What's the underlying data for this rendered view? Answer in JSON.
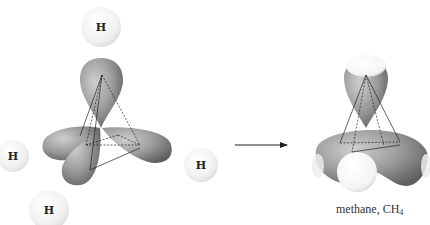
{
  "diagram": {
    "type": "reaction-scheme",
    "left": {
      "name": "sp3 hybrid orbitals of carbon with four hydrogen atoms",
      "hydrogens": [
        {
          "label": "H",
          "cx": 101,
          "cy": 27,
          "r": 20
        },
        {
          "label": "H",
          "cx": 13,
          "cy": 156,
          "r": 16
        },
        {
          "label": "H",
          "cx": 201,
          "cy": 165,
          "r": 17
        },
        {
          "label": "H",
          "cx": 49,
          "cy": 210,
          "r": 20
        }
      ]
    },
    "arrow": {
      "x1": 235,
      "y1": 145,
      "x2": 288,
      "y2": 145
    },
    "right": {
      "caption_prefix": "methane, CH",
      "caption_subscript": "4"
    },
    "colors": {
      "lobe_dark": "#6e6e6e",
      "lobe_mid": "#9a9a9a",
      "lobe_light": "#c8c8c8",
      "hydrogen_fill": "#f2f2f2",
      "line": "#222222"
    }
  }
}
